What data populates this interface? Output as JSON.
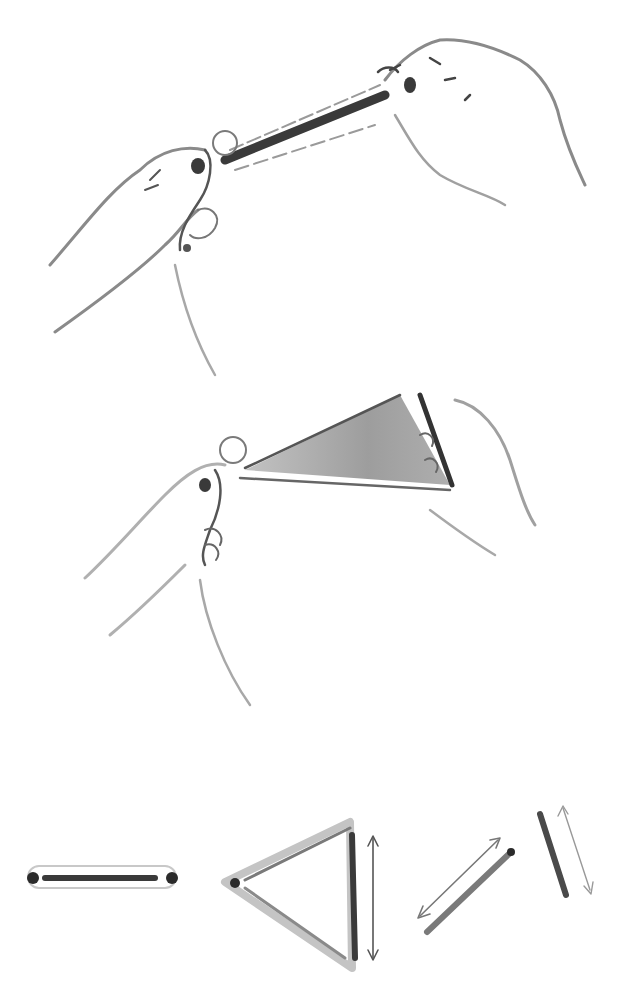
{
  "illustration": {
    "style": "ink wash instructional sketch",
    "colors": {
      "ink_dark": "#2b2b2b",
      "ink_mid": "#6a6a6a",
      "ink_light": "#a8a8a8",
      "wash": "#8c8c8c",
      "paper": "#ffffff"
    },
    "panels": [
      {
        "id": "step-1",
        "depicts": "two hands holding a closed tube-like band stretched between them"
      },
      {
        "id": "step-2",
        "depicts": "two hands pulling the band open into a shaded triangular shape"
      },
      {
        "id": "step-3",
        "depicts": "diagram sequence: flat band, triangle with vertical arrow, diagonal strip with double arrow, tilted strip with double arrow"
      }
    ]
  }
}
